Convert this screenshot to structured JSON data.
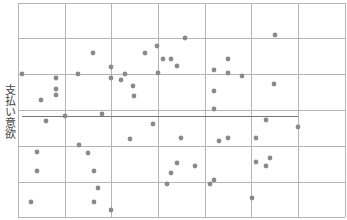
{
  "chart_data": {
    "type": "scatter",
    "title": "",
    "xlabel": "",
    "ylabel": "支払い意欲",
    "grid": true,
    "legend": null,
    "plot_area_px": {
      "left": 18,
      "top": 3,
      "right": 345,
      "bottom": 217
    },
    "grid_x_px": [
      18,
      65,
      111,
      158,
      205,
      251,
      298,
      345
    ],
    "grid_y_px": [
      3,
      38,
      74,
      110,
      146,
      182,
      217
    ],
    "mean_line": {
      "y_px": 116,
      "x_start_px": 22,
      "x_end_px": 298
    },
    "colors": {
      "point": "#8a8a8a",
      "grid": "#b5b5b5",
      "mean_line": "#777777",
      "label": "#444444"
    },
    "points_px": [
      [
        22,
        74
      ],
      [
        41,
        100
      ],
      [
        56,
        78
      ],
      [
        56,
        89
      ],
      [
        56,
        95
      ],
      [
        78,
        74
      ],
      [
        93,
        53
      ],
      [
        111,
        67
      ],
      [
        111,
        78
      ],
      [
        121,
        80
      ],
      [
        125,
        74
      ],
      [
        133,
        86
      ],
      [
        134,
        96
      ],
      [
        145,
        53
      ],
      [
        157,
        46
      ],
      [
        158,
        73
      ],
      [
        163,
        59
      ],
      [
        171,
        59
      ],
      [
        177,
        66
      ],
      [
        185,
        38
      ],
      [
        214,
        70
      ],
      [
        214,
        91
      ],
      [
        228,
        59
      ],
      [
        228,
        73
      ],
      [
        242,
        76
      ],
      [
        275,
        35
      ],
      [
        274,
        84
      ],
      [
        46,
        121
      ],
      [
        65,
        116
      ],
      [
        102,
        114
      ],
      [
        37,
        152
      ],
      [
        37,
        171
      ],
      [
        79,
        145
      ],
      [
        88,
        153
      ],
      [
        94,
        171
      ],
      [
        98,
        188
      ],
      [
        94,
        202
      ],
      [
        31,
        202
      ],
      [
        111,
        210
      ],
      [
        130,
        139
      ],
      [
        153,
        124
      ],
      [
        181,
        138
      ],
      [
        177,
        163
      ],
      [
        171,
        173
      ],
      [
        167,
        184
      ],
      [
        195,
        166
      ],
      [
        214,
        109
      ],
      [
        266,
        120
      ],
      [
        298,
        127
      ],
      [
        219,
        141
      ],
      [
        228,
        138
      ],
      [
        256,
        138
      ],
      [
        256,
        162
      ],
      [
        270,
        158
      ],
      [
        266,
        166
      ],
      [
        210,
        184
      ],
      [
        214,
        180
      ],
      [
        252,
        198
      ]
    ]
  }
}
